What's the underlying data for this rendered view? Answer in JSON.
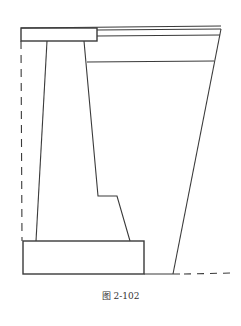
{
  "figure": {
    "caption": "图 2-102",
    "stroke_color": "#3a3a3a",
    "background": "#ffffff"
  }
}
